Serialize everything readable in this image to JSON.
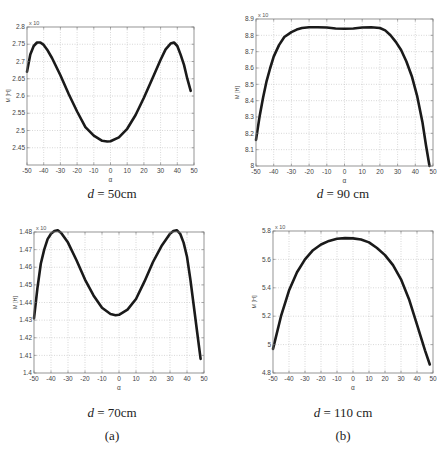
{
  "chart_data": [
    {
      "type": "line",
      "panel": "top-left",
      "caption_var": "d",
      "caption_value": "= 50cm",
      "xlabel": "α",
      "ylabel": "M [H]",
      "y_exponent_label": "x 10",
      "xlim": [
        -50,
        50
      ],
      "ylim": [
        2.4,
        2.8
      ],
      "xticks": [
        -50,
        -40,
        -30,
        -20,
        -10,
        0,
        10,
        20,
        30,
        40,
        50
      ],
      "yticks": [
        2.45,
        2.5,
        2.55,
        2.6,
        2.65,
        2.7,
        2.75,
        2.8
      ],
      "ytick_labels": [
        "2.45",
        "2.5",
        "2.55",
        "2.6",
        "2.65",
        "2.7",
        "2.75",
        "2.8"
      ],
      "grid": true,
      "x": [
        -50,
        -48,
        -46,
        -44,
        -42,
        -40,
        -38,
        -35,
        -30,
        -25,
        -20,
        -15,
        -10,
        -5,
        -2,
        0,
        5,
        10,
        15,
        20,
        25,
        30,
        33,
        36,
        38,
        40,
        42,
        44,
        46,
        48
      ],
      "y": [
        2.67,
        2.72,
        2.745,
        2.755,
        2.755,
        2.748,
        2.735,
        2.71,
        2.66,
        2.605,
        2.555,
        2.51,
        2.485,
        2.47,
        2.468,
        2.469,
        2.48,
        2.505,
        2.545,
        2.595,
        2.65,
        2.705,
        2.735,
        2.752,
        2.755,
        2.745,
        2.72,
        2.69,
        2.65,
        2.615
      ]
    },
    {
      "type": "line",
      "panel": "top-right",
      "caption_var": "d",
      "caption_value": "= 90 cm",
      "xlabel": "α",
      "ylabel": "M [H]",
      "y_exponent_label": "x 10",
      "xlim": [
        -50,
        50
      ],
      "ylim": [
        8.0,
        8.9
      ],
      "xticks": [
        -50,
        -40,
        -30,
        -20,
        -10,
        0,
        10,
        20,
        30,
        40,
        50
      ],
      "yticks": [
        8.0,
        8.1,
        8.2,
        8.3,
        8.4,
        8.5,
        8.6,
        8.7,
        8.8,
        8.9
      ],
      "ytick_labels": [
        "8",
        "8.1",
        "8.2",
        "8.3",
        "8.4",
        "8.5",
        "8.6",
        "8.7",
        "8.8",
        "8.9"
      ],
      "grid": true,
      "x": [
        -50,
        -48,
        -46,
        -44,
        -42,
        -40,
        -37,
        -34,
        -30,
        -27,
        -24,
        -20,
        -15,
        -10,
        -5,
        0,
        5,
        10,
        15,
        20,
        23,
        26,
        29,
        32,
        35,
        38,
        41,
        44,
        46,
        48
      ],
      "y": [
        8.16,
        8.3,
        8.42,
        8.52,
        8.6,
        8.67,
        8.74,
        8.79,
        8.82,
        8.835,
        8.845,
        8.85,
        8.85,
        8.848,
        8.842,
        8.84,
        8.842,
        8.848,
        8.85,
        8.845,
        8.83,
        8.8,
        8.76,
        8.71,
        8.64,
        8.55,
        8.43,
        8.27,
        8.13,
        8.0
      ]
    },
    {
      "type": "line",
      "panel": "bottom-left",
      "caption_var": "d",
      "caption_value": "= 70cm",
      "sublabel": "(a)",
      "xlabel": "α",
      "ylabel": "M [H]",
      "y_exponent_label": "x 10",
      "xlim": [
        -50,
        50
      ],
      "ylim": [
        1.4,
        1.48
      ],
      "xticks": [
        -50,
        -40,
        -30,
        -20,
        -10,
        0,
        10,
        20,
        30,
        40,
        50
      ],
      "yticks": [
        1.4,
        1.41,
        1.42,
        1.43,
        1.44,
        1.45,
        1.46,
        1.47,
        1.48
      ],
      "ytick_labels": [
        "1.4",
        "1.41",
        "1.42",
        "1.43",
        "1.44",
        "1.45",
        "1.46",
        "1.47",
        "1.48"
      ],
      "grid": true,
      "x": [
        -50,
        -48,
        -46,
        -44,
        -42,
        -40,
        -38,
        -36,
        -34,
        -30,
        -25,
        -20,
        -15,
        -10,
        -5,
        -2,
        0,
        5,
        10,
        15,
        20,
        25,
        30,
        32,
        34,
        36,
        38,
        40,
        42,
        44,
        46,
        48
      ],
      "y": [
        1.431,
        1.448,
        1.462,
        1.47,
        1.476,
        1.479,
        1.4805,
        1.481,
        1.4795,
        1.474,
        1.464,
        1.453,
        1.444,
        1.437,
        1.4335,
        1.4328,
        1.433,
        1.436,
        1.442,
        1.452,
        1.463,
        1.472,
        1.479,
        1.4805,
        1.481,
        1.479,
        1.474,
        1.466,
        1.453,
        1.438,
        1.423,
        1.408
      ]
    },
    {
      "type": "line",
      "panel": "bottom-right",
      "caption_var": "d",
      "caption_value": "= 110 cm",
      "sublabel": "(b)",
      "xlabel": "α",
      "ylabel": "M [H]",
      "y_exponent_label": "x 10",
      "xlim": [
        -50,
        50
      ],
      "ylim": [
        4.8,
        5.8
      ],
      "xticks": [
        -50,
        -40,
        -30,
        -20,
        -10,
        0,
        10,
        20,
        30,
        40,
        50
      ],
      "yticks": [
        4.8,
        5.0,
        5.2,
        5.4,
        5.6,
        5.8
      ],
      "ytick_labels": [
        "4.8",
        "5",
        "5.2",
        "5.4",
        "5.6",
        "5.8"
      ],
      "grid": true,
      "x": [
        -50,
        -45,
        -40,
        -35,
        -30,
        -25,
        -20,
        -15,
        -10,
        -5,
        0,
        5,
        10,
        15,
        20,
        25,
        30,
        35,
        40,
        45,
        48
      ],
      "y": [
        4.97,
        5.2,
        5.38,
        5.51,
        5.6,
        5.665,
        5.705,
        5.73,
        5.745,
        5.75,
        5.748,
        5.74,
        5.72,
        5.68,
        5.63,
        5.56,
        5.46,
        5.32,
        5.14,
        4.96,
        4.86
      ]
    }
  ]
}
